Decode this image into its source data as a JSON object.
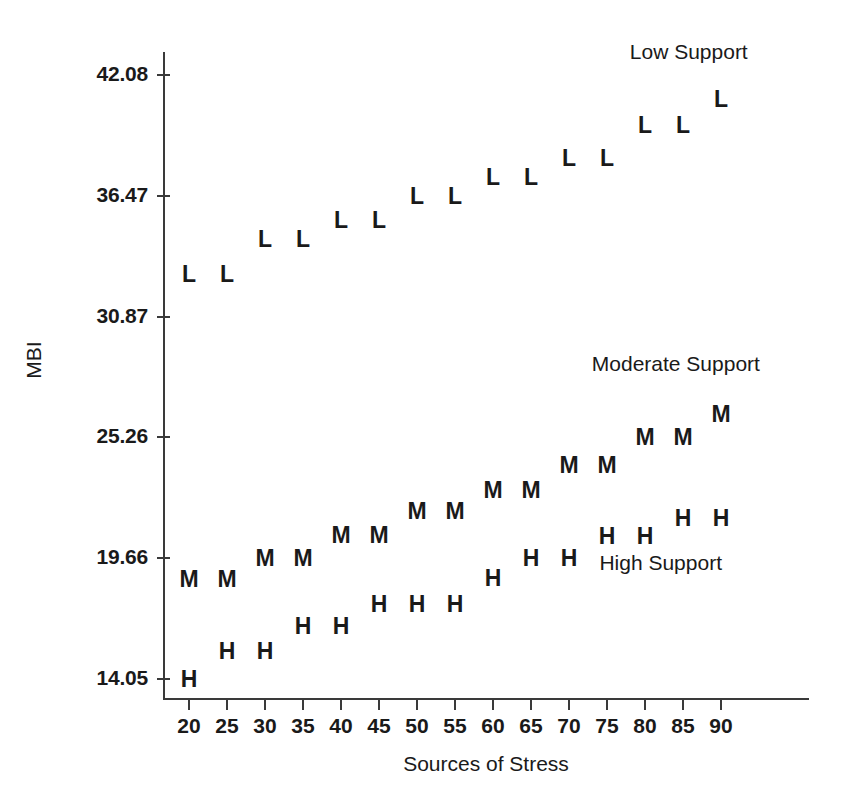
{
  "chart_data": {
    "type": "scatter",
    "title": "",
    "xlabel": "Sources of Stress",
    "ylabel": "MBI",
    "x": [
      20,
      25,
      30,
      35,
      40,
      45,
      50,
      55,
      60,
      65,
      70,
      75,
      80,
      85,
      90
    ],
    "xticks": [
      "20",
      "25",
      "30",
      "35",
      "40",
      "45",
      "50",
      "55",
      "60",
      "65",
      "70",
      "75",
      "80",
      "85",
      "90"
    ],
    "yticks": [
      "14.05",
      "19.66",
      "25.26",
      "30.87",
      "36.47",
      "42.08"
    ],
    "ytick_values": [
      14.05,
      19.66,
      25.26,
      30.87,
      36.47,
      42.08
    ],
    "xlim": [
      18,
      99
    ],
    "ylim": [
      13.0,
      43.2
    ],
    "grid": false,
    "legend_position": "inline-annotations",
    "series": [
      {
        "name": "Low Support",
        "marker": "L",
        "label": "Low Support",
        "label_x": 78,
        "label_y": 43.1,
        "values": [
          32.85,
          32.85,
          34.45,
          34.45,
          35.35,
          35.35,
          36.45,
          36.45,
          37.35,
          37.35,
          38.25,
          38.25,
          39.75,
          39.75,
          40.95
        ]
      },
      {
        "name": "Moderate Support",
        "marker": "M",
        "label": "Moderate Support",
        "label_x": 73,
        "label_y": 28.6,
        "values": [
          18.7,
          18.7,
          19.66,
          19.66,
          20.75,
          20.75,
          21.85,
          21.85,
          22.8,
          22.8,
          24.0,
          24.0,
          25.26,
          25.26,
          26.35
        ]
      },
      {
        "name": "High Support",
        "marker": "H",
        "label": "High Support",
        "label_x": 74,
        "label_y": 19.4,
        "values": [
          14.05,
          15.35,
          15.35,
          16.5,
          16.5,
          17.55,
          17.55,
          17.55,
          18.75,
          19.66,
          19.66,
          20.7,
          20.7,
          21.5,
          21.5
        ]
      }
    ]
  },
  "axis": {
    "y_title": "MBI",
    "x_title": "Sources of Stress"
  }
}
